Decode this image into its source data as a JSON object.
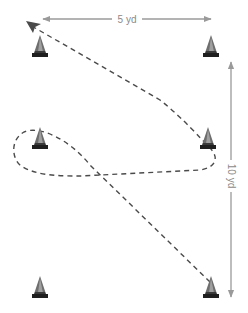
{
  "diagram": {
    "type": "cone drill",
    "dimensions": {
      "width_label": "5 yd",
      "height_label": "10 yd"
    },
    "cones": [
      {
        "id": "top-left",
        "x": 40,
        "y": 50
      },
      {
        "id": "top-right",
        "x": 211,
        "y": 50
      },
      {
        "id": "middle-left",
        "x": 40,
        "y": 144
      },
      {
        "id": "middle-right",
        "x": 208,
        "y": 144
      },
      {
        "id": "bottom-left",
        "x": 40,
        "y": 290
      },
      {
        "id": "bottom-right",
        "x": 211,
        "y": 290
      }
    ],
    "path": {
      "style": "dashed",
      "description": "Start at bottom-right cone, run diagonally to middle-left cone, loop around it, run across to middle-right cone, loop around it, finish diagonally at top-left cone"
    },
    "colors": {
      "cone_body": "#7a7a7a",
      "cone_highlight": "#a8a8a8",
      "cone_base": "#1f1f1f",
      "path": "#4a4a4a",
      "dimension_line": "#9a9a9a",
      "background": "#ffffff"
    }
  }
}
